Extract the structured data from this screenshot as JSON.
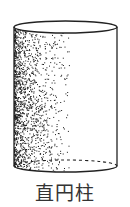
{
  "figure": {
    "shape": "right-circular-cylinder",
    "caption": "直円柱",
    "stroke_color": "#222222",
    "shading_color": "#1a1a1a",
    "top_ellipse": {
      "cx": 65.5,
      "cy": 27,
      "rx": 51.5,
      "ry": 6
    },
    "bottom_ellipse": {
      "cx": 65.5,
      "cy": 166,
      "rx": 51.5,
      "ry": 6
    },
    "hidden_edge": "dashed"
  }
}
